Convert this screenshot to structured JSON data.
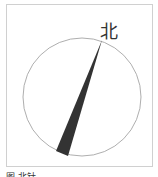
{
  "diagram": {
    "north_label": "北",
    "caption": "图 北针"
  },
  "colors": {
    "frame": "#d0d0d0",
    "circle": "#999999",
    "needle": "#333333"
  }
}
